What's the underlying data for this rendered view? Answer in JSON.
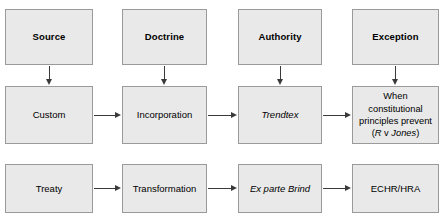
{
  "diagram": {
    "title": "Incorporation and transformation of international law into domestic law",
    "background_color": "#ffffff",
    "node_fill_color": "#e9e9e9",
    "node_border_color": "#9a9a9a",
    "arrow_color": "#3a3a3a",
    "columns": [
      {
        "key": "source",
        "header": "Source"
      },
      {
        "key": "doctrine",
        "header": "Doctrine"
      },
      {
        "key": "authority",
        "header": "Authority"
      },
      {
        "key": "exception",
        "header": "Exception"
      }
    ],
    "rows": [
      {
        "key": "header-row",
        "cells": [
          {
            "label": "Source",
            "style": "bold"
          },
          {
            "label": "Doctrine",
            "style": "bold"
          },
          {
            "label": "Authority",
            "style": "bold"
          },
          {
            "label": "Exception",
            "style": "bold"
          }
        ]
      },
      {
        "key": "custom-row",
        "cells": [
          {
            "label": "Custom",
            "style": "plain"
          },
          {
            "label": "Incorporation",
            "style": "plain"
          },
          {
            "label": "Trendtex",
            "style": "italic"
          },
          {
            "label": "When constitutional\nprinciples prevent\n(R v Jones)",
            "style": "mixed"
          }
        ]
      },
      {
        "key": "treaty-row",
        "cells": [
          {
            "label": "Treaty",
            "style": "plain"
          },
          {
            "label": "Transformation",
            "style": "plain"
          },
          {
            "label": "Ex parte Brind",
            "style": "italic"
          },
          {
            "label": "ECHR/HRA",
            "style": "plain"
          }
        ]
      }
    ],
    "exception_note": {
      "line1": "When constitutional",
      "line2": "principles prevent",
      "case_open": "(",
      "case_party_a": "R",
      "case_v": " v ",
      "case_party_b": "Jones",
      "case_close": ")"
    },
    "arrows": {
      "vertical": [
        {
          "from": "Source",
          "to": "Custom"
        },
        {
          "from": "Doctrine",
          "to": "Incorporation"
        },
        {
          "from": "Authority",
          "to": "Trendtex"
        },
        {
          "from": "Exception",
          "to": "When constitutional principles prevent (R v Jones)"
        }
      ],
      "horizontal": [
        {
          "from": "Custom",
          "to": "Incorporation"
        },
        {
          "from": "Incorporation",
          "to": "Trendtex"
        },
        {
          "from": "Trendtex",
          "to": "When constitutional principles prevent (R v Jones)"
        },
        {
          "from": "Treaty",
          "to": "Transformation"
        },
        {
          "from": "Transformation",
          "to": "Ex parte Brind"
        },
        {
          "from": "Ex parte Brind",
          "to": "ECHR/HRA"
        }
      ]
    }
  }
}
